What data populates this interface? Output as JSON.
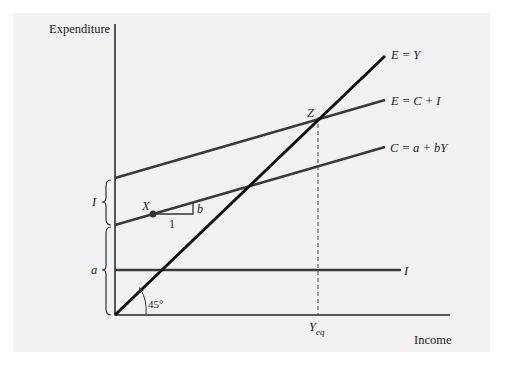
{
  "figure": {
    "axes": {
      "y_label": "Expenditure",
      "x_label": "Income"
    },
    "lines": [
      {
        "id": "e-equals-y",
        "label": "E = Y",
        "color": "#111111"
      },
      {
        "id": "e-equals-c-plus-i",
        "label": "E = C + I",
        "color": "#3a3a3a"
      },
      {
        "id": "consumption",
        "label": "C = a + bY",
        "color": "#3a3a3a"
      },
      {
        "id": "investment",
        "label": "I",
        "color": "#3a3a3a"
      }
    ],
    "points": {
      "equilibrium": "Z",
      "x_point": "X",
      "equilibrium_income": "Y",
      "equilibrium_income_sub": "eq"
    },
    "annotations": {
      "slope_rise": "b",
      "slope_run": "1",
      "angle": "45°",
      "brace_investment": "I",
      "brace_autonomous": "a"
    }
  }
}
